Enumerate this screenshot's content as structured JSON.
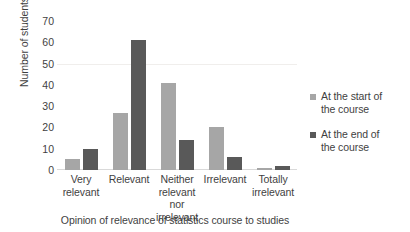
{
  "chart_data": {
    "type": "bar",
    "title": "",
    "categories": [
      "Very\nrelevant",
      "Relevant",
      "Neither\nrelevant nor\nirrelevant",
      "Irrelevant",
      "Totally\nirrelevant"
    ],
    "series": [
      {
        "name": "At the start of the course",
        "values": [
          5,
          27,
          41,
          20,
          1
        ],
        "color": "#a6a6a6"
      },
      {
        "name": "At the end of the course",
        "values": [
          10,
          61,
          14,
          6,
          2
        ],
        "color": "#595959"
      }
    ],
    "xlabel": "Opinion of relevance of statistics course to studies",
    "ylabel": "Number of students",
    "ylim": [
      0,
      70
    ],
    "yticks": [
      0,
      10,
      20,
      30,
      40,
      50,
      60,
      70
    ],
    "ytick_labels": [
      "0",
      "10",
      "20",
      "30",
      "40",
      "50",
      "60",
      "70"
    ],
    "grid": "horizontal-faint-at-50",
    "legend_position": "right"
  },
  "axis": {
    "y_title": "Number of students",
    "x_title": "Opinion of relevance of statistics course to studies"
  },
  "categories": {
    "c0_line1": "Very",
    "c0_line2": "relevant",
    "c1_line1": "Relevant",
    "c2_line1": "Neither",
    "c2_line2": "relevant nor",
    "c2_line3": "irrelevant",
    "c3_line1": "Irrelevant",
    "c4_line1": "Totally",
    "c4_line2": "irrelevant"
  },
  "yticks": {
    "t70": "70",
    "t60": "60",
    "t50": "50",
    "t40": "40",
    "t30": "30",
    "t20": "20",
    "t10": "10",
    "t0": "0"
  },
  "legend": {
    "items": [
      {
        "line1": "At the start of",
        "line2": "the course",
        "color": "#a6a6a6"
      },
      {
        "line1": "At the end of",
        "line2": "the course",
        "color": "#595959"
      }
    ]
  }
}
